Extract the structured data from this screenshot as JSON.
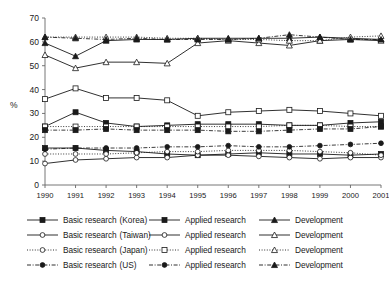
{
  "chart_data": {
    "type": "line",
    "title": "",
    "xlabel": "",
    "ylabel": "%",
    "x": [
      1990,
      1991,
      1992,
      1993,
      1994,
      1995,
      1996,
      1997,
      1998,
      1999,
      2000,
      2001
    ],
    "xtick_labels": [
      "1990",
      "1991",
      "1992",
      "1993",
      "1994",
      "1995",
      "1996",
      "1997",
      "1998",
      "1999",
      "2000",
      "2001"
    ],
    "ytick_labels": [
      "0",
      "10",
      "20",
      "30",
      "40",
      "50",
      "60",
      "70"
    ],
    "yticks": [
      0,
      10,
      20,
      30,
      40,
      50,
      60,
      70
    ],
    "ylim": [
      0,
      70
    ],
    "grid": false,
    "legend_position": "bottom",
    "series": [
      {
        "name": "Basic research (Korea)",
        "country": "Korea",
        "category": "Basic research",
        "marker": "filled-square",
        "linestyle": "solid",
        "values": [
          15.5,
          15.5,
          14.5,
          14.0,
          13.0,
          12.5,
          13.0,
          13.5,
          13.0,
          13.0,
          12.5,
          13.0
        ]
      },
      {
        "name": "Applied research (Korea)",
        "country": "Korea",
        "category": "Applied research",
        "marker": "filled-square",
        "linestyle": "solid",
        "values": [
          24.5,
          30.5,
          26.0,
          24.5,
          25.0,
          25.5,
          25.5,
          25.5,
          25.0,
          25.0,
          26.0,
          26.5
        ]
      },
      {
        "name": "Development (Korea)",
        "country": "Korea",
        "category": "Development",
        "marker": "filled-triangle",
        "linestyle": "solid",
        "values": [
          59.5,
          54.0,
          60.5,
          61.0,
          61.0,
          61.5,
          61.5,
          61.5,
          61.5,
          62.0,
          61.5,
          61.0
        ]
      },
      {
        "name": "Basic research (Taiwan)",
        "country": "Taiwan",
        "category": "Basic research",
        "marker": "open-circle",
        "linestyle": "solid",
        "values": [
          9.0,
          10.5,
          11.0,
          11.5,
          11.5,
          12.5,
          12.5,
          12.0,
          11.5,
          11.0,
          11.5,
          11.5
        ]
      },
      {
        "name": "Applied research (Taiwan)",
        "country": "Taiwan",
        "category": "Applied research",
        "marker": "open-square",
        "linestyle": "solid",
        "values": [
          36.0,
          40.5,
          36.5,
          36.5,
          35.5,
          29.0,
          30.5,
          31.0,
          31.5,
          31.0,
          30.0,
          29.0
        ]
      },
      {
        "name": "Development (Taiwan)",
        "country": "Taiwan",
        "category": "Development",
        "marker": "open-triangle",
        "linestyle": "solid",
        "values": [
          54.5,
          49.0,
          51.5,
          51.5,
          51.0,
          59.5,
          60.5,
          59.5,
          58.5,
          60.5,
          61.0,
          60.5
        ]
      },
      {
        "name": "Basic research (Japan)",
        "country": "Japan",
        "category": "Basic research",
        "marker": "open-circle-dotted",
        "linestyle": "dotted",
        "values": [
          13.0,
          13.0,
          13.0,
          13.5,
          14.0,
          14.0,
          14.5,
          14.5,
          14.5,
          14.0,
          13.5,
          12.5
        ]
      },
      {
        "name": "Applied research (Japan)",
        "country": "Japan",
        "category": "Applied research",
        "marker": "open-square-dotted",
        "linestyle": "dotted",
        "values": [
          24.5,
          24.5,
          24.5,
          24.5,
          24.5,
          24.5,
          24.5,
          24.5,
          25.0,
          25.0,
          24.5,
          24.5
        ]
      },
      {
        "name": "Development (Japan)",
        "country": "Japan",
        "category": "Development",
        "marker": "open-triangle-dotted",
        "linestyle": "dotted",
        "values": [
          62.0,
          62.0,
          62.0,
          62.0,
          61.5,
          61.5,
          61.0,
          61.0,
          60.5,
          60.5,
          62.0,
          62.5
        ]
      },
      {
        "name": "Basic research (US)",
        "country": "US",
        "category": "Basic research",
        "marker": "filled-circle-dashdot",
        "linestyle": "dashdot",
        "values": [
          15.0,
          15.5,
          15.5,
          15.5,
          16.0,
          16.0,
          16.5,
          16.0,
          16.0,
          16.5,
          17.0,
          17.5
        ]
      },
      {
        "name": "Applied research (US)",
        "country": "US",
        "category": "Applied research",
        "marker": "filled-square-dashdot",
        "linestyle": "dashdot",
        "values": [
          23.0,
          23.0,
          23.5,
          23.0,
          23.0,
          23.0,
          22.5,
          22.5,
          23.0,
          23.5,
          23.5,
          24.5
        ]
      },
      {
        "name": "Development (US)",
        "country": "US",
        "category": "Development",
        "marker": "filled-triangle-dashdot",
        "linestyle": "dashdot",
        "values": [
          62.0,
          61.5,
          61.0,
          61.5,
          61.0,
          61.0,
          61.0,
          61.5,
          63.0,
          62.0,
          61.0,
          61.0
        ]
      }
    ]
  },
  "axes": {
    "y_title": "%"
  },
  "legend": {
    "rows": [
      {
        "country": "(Korea)",
        "basic": "Basic research",
        "applied": "Applied research",
        "development": "Development",
        "key_basic": "filled-square-solid",
        "key_applied": "filled-square-solid",
        "key_development": "filled-triangle-solid"
      },
      {
        "country": "(Taiwan)",
        "basic": "Basic research",
        "applied": "Applied research",
        "development": "Development",
        "key_basic": "open-circle-solid",
        "key_applied": "open-circle-solid",
        "key_development": "open-triangle-solid"
      },
      {
        "country": "(Japan)",
        "basic": "Basic research",
        "applied": "Applied research",
        "development": "Development",
        "key_basic": "open-circle-dotted",
        "key_applied": "open-square-dotted",
        "key_development": "open-triangle-dotted"
      },
      {
        "country": "(US)",
        "basic": "Basic research",
        "applied": "Applied research",
        "development": "Development",
        "key_basic": "filled-circle-dashdot",
        "key_applied": "filled-circle-dashdot",
        "key_development": "filled-triangle-dashdot"
      }
    ]
  },
  "colors": {
    "ink": "#1a1a1a",
    "axis": "#666666",
    "background": "#ffffff"
  }
}
